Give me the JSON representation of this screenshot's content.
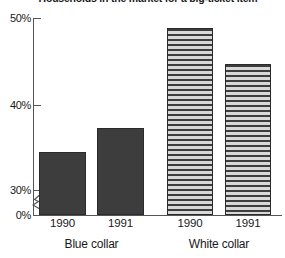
{
  "chart_data": {
    "type": "bar",
    "title": "Households in the market for a big-ticket item",
    "categories": [
      "1990",
      "1991",
      "1990",
      "1991"
    ],
    "groups": [
      {
        "label": "Blue collar",
        "indices": [
          0,
          1
        ]
      },
      {
        "label": "White collar",
        "indices": [
          2,
          3
        ]
      }
    ],
    "series": [
      {
        "name": "Percent of households",
        "values": [
          34.4,
          37.2,
          48.8,
          44.6
        ]
      }
    ],
    "bar_styles": [
      "solid",
      "solid",
      "hatch",
      "hatch"
    ],
    "xlabel": "",
    "ylabel": "",
    "ylim": [
      30,
      50
    ],
    "axis_break": true,
    "axis_break_below": 30,
    "yticks": [
      {
        "value": 50,
        "label": "50%"
      },
      {
        "value": 40,
        "label": "40%"
      },
      {
        "value": 30,
        "label": "30%"
      },
      {
        "value": 0,
        "label": "0%"
      }
    ],
    "grid": false,
    "legend": "none",
    "colors": {
      "bar_solid": "#3d3d3d",
      "bar_hatch_dark": "#3d3d3d",
      "bar_hatch_light": "#d8d8d8",
      "axis": "#555555",
      "text": "#1a1a1a",
      "background": "#ffffff"
    }
  }
}
